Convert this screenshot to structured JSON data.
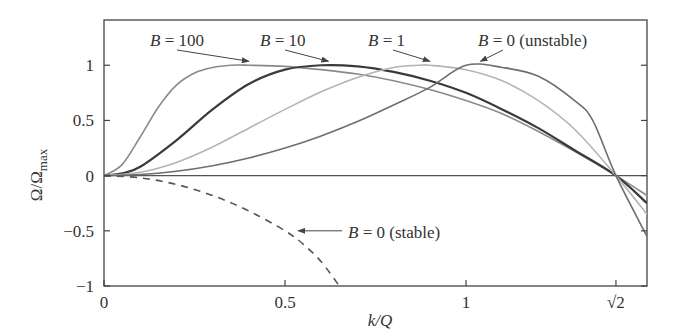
{
  "chart_data": {
    "type": "line",
    "title": "",
    "xlabel": "k/Q",
    "ylabel": "Ω/Ωmax",
    "ylabel_main": "Ω/Ω",
    "ylabel_sub": "max",
    "xlim": [
      0,
      1.5
    ],
    "ylim": [
      -1,
      1.41
    ],
    "grid": false,
    "legend": "none (inline annotations)",
    "x_ticks": [
      {
        "value": 0,
        "label": "0"
      },
      {
        "value": 0.5,
        "label": "0.5"
      },
      {
        "value": 1,
        "label": "1"
      },
      {
        "value": 1.41421356,
        "label": "√2"
      }
    ],
    "y_ticks": [
      {
        "value": 1,
        "label": "1"
      },
      {
        "value": 0.5,
        "label": "0.5"
      },
      {
        "value": 0,
        "label": "0"
      },
      {
        "value": -0.5,
        "label": "−0.5"
      },
      {
        "value": -1,
        "label": "−1"
      }
    ],
    "reference_line": {
      "y": 0
    },
    "series": [
      {
        "name": "B = 100",
        "color": "#8a8a8a",
        "style": "solid",
        "x": [
          0,
          0.05,
          0.1,
          0.15,
          0.2,
          0.25,
          0.3,
          0.35,
          0.4,
          0.5,
          0.6,
          0.7,
          0.8,
          0.9,
          1.0,
          1.1,
          1.2,
          1.3,
          1.41421356,
          1.5
        ],
        "y": [
          0,
          0.1,
          0.35,
          0.62,
          0.82,
          0.93,
          0.98,
          1.0,
          1.0,
          0.99,
          0.96,
          0.92,
          0.86,
          0.78,
          0.68,
          0.56,
          0.4,
          0.22,
          0,
          -0.18
        ]
      },
      {
        "name": "B = 10",
        "color": "#3a3a3a",
        "style": "solid",
        "x": [
          0,
          0.05,
          0.1,
          0.2,
          0.3,
          0.4,
          0.5,
          0.6,
          0.7,
          0.8,
          0.9,
          1.0,
          1.1,
          1.2,
          1.3,
          1.41421356,
          1.5
        ],
        "y": [
          0,
          0.02,
          0.08,
          0.32,
          0.6,
          0.83,
          0.96,
          1.0,
          0.99,
          0.94,
          0.86,
          0.75,
          0.6,
          0.43,
          0.23,
          0,
          -0.25
        ]
      },
      {
        "name": "B = 1",
        "color": "#b4b4b4",
        "style": "solid",
        "x": [
          0,
          0.1,
          0.2,
          0.3,
          0.4,
          0.5,
          0.6,
          0.7,
          0.8,
          0.87,
          0.9,
          1.0,
          1.1,
          1.2,
          1.3,
          1.41421356,
          1.5
        ],
        "y": [
          0,
          0.03,
          0.12,
          0.26,
          0.43,
          0.6,
          0.76,
          0.89,
          0.98,
          1.0,
          1.0,
          0.96,
          0.86,
          0.68,
          0.42,
          0,
          -0.35
        ]
      },
      {
        "name": "B = 0 (unstable)",
        "color": "#6e6e6e",
        "style": "solid",
        "x": [
          0,
          0.1,
          0.2,
          0.3,
          0.4,
          0.5,
          0.6,
          0.7,
          0.8,
          0.9,
          1.0,
          1.1,
          1.2,
          1.3,
          1.35,
          1.41421356,
          1.5
        ],
        "y": [
          0,
          0.01,
          0.04,
          0.09,
          0.16,
          0.25,
          0.36,
          0.49,
          0.64,
          0.8,
          1.0,
          0.98,
          0.9,
          0.68,
          0.5,
          0,
          -0.55
        ]
      },
      {
        "name": "B = 0 (stable)",
        "color": "#555555",
        "style": "dashed",
        "x": [
          0,
          0.1,
          0.2,
          0.3,
          0.4,
          0.5,
          0.55,
          0.6,
          0.65
        ],
        "y": [
          0,
          -0.02,
          -0.08,
          -0.18,
          -0.32,
          -0.5,
          -0.62,
          -0.78,
          -1.0
        ]
      }
    ],
    "annotations": [
      {
        "text_B": "B",
        "text_rest": " = 100",
        "points_to": "B = 100",
        "arrow_to": [
          0.4,
          1.0
        ]
      },
      {
        "text_B": "B",
        "text_rest": " = 10",
        "points_to": "B = 10",
        "arrow_to": [
          0.62,
          1.0
        ]
      },
      {
        "text_B": "B",
        "text_rest": " = 1",
        "points_to": "B = 1",
        "arrow_to": [
          0.9,
          1.0
        ]
      },
      {
        "text_B": "B",
        "text_rest": " = 0 (unstable)",
        "points_to": "B = 0 (unstable)",
        "arrow_to": [
          1.04,
          1.0
        ]
      },
      {
        "text_B": "B",
        "text_rest": " = 0 (stable)",
        "points_to": "B = 0 (stable)",
        "arrow_to": [
          0.52,
          -0.5
        ]
      }
    ]
  }
}
